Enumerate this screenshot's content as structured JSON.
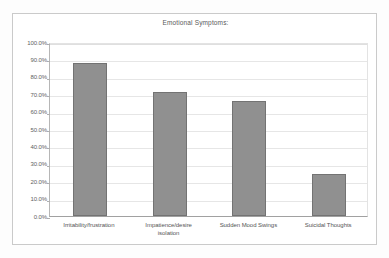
{
  "chart_data": {
    "type": "bar",
    "title": "Emotional Symptoms:",
    "xlabel": "",
    "ylabel": "",
    "categories": [
      "Irritability/frustration",
      "Impatience/desire isolation",
      "Sudden Mood Swings",
      "Suicidal Thoughts"
    ],
    "values": [
      88.0,
      71.0,
      66.0,
      24.0
    ],
    "value_labels": [
      "88.0%",
      "71.0%",
      "66.0%",
      "24.0%"
    ],
    "ylim": [
      0,
      100
    ],
    "ytick_values": [
      0,
      10,
      20,
      30,
      40,
      50,
      60,
      70,
      80,
      90,
      100
    ],
    "ytick_labels": [
      "100.0%",
      "90.0%",
      "80.0%",
      "70.0%",
      "60.0%",
      "50.0%",
      "40.0%",
      "30.0%",
      "20.0%",
      "10.0%",
      "0.0%"
    ],
    "grid": true,
    "legend": false,
    "legend_position": "none",
    "series": [
      {
        "name": "Emotional Symptoms",
        "values": [
          88.0,
          71.0,
          66.0,
          24.0
        ]
      }
    ],
    "colors": {
      "bar_fill": "#8c8c8c",
      "bar_border": "#6e6e6e",
      "gridline": "#e6e6e6",
      "axis": "#9e9e9e",
      "plot_background": "#ffffff",
      "card_background": "#ffffff",
      "card_border": "#c9c9c9",
      "page_background": "#fdfdfd",
      "title_text": "#555555",
      "tick_text": "#5a5a5a",
      "category_text": "#4f4f4f"
    }
  },
  "xlabel_lines": {
    "cat0": [
      "Irritability/frustration"
    ],
    "cat1": [
      "Impatience/desire",
      "isolation"
    ],
    "cat2": [
      "Sudden Mood Swings"
    ],
    "cat3": [
      "Suicidal Thoughts"
    ]
  }
}
